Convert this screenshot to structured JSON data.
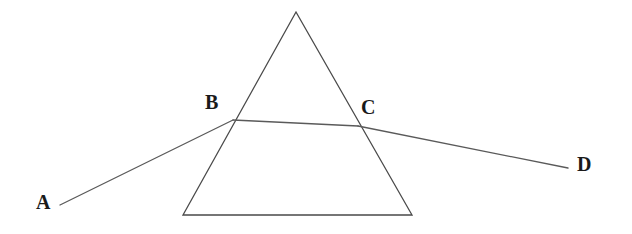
{
  "figure": {
    "kind": "optics-ray-diagram",
    "background_color": "#ffffff",
    "stroke_color": "#555555",
    "prism_stroke_color": "#4a4a4a",
    "ray_stroke_color": "#5a5a5a",
    "label_color": "#1a1a1a"
  },
  "labels": {
    "a": "A",
    "b": "B",
    "c": "C",
    "d": "D"
  },
  "geometry": {
    "prism": {
      "apex": {
        "x": 296,
        "y": 12
      },
      "bottom_left": {
        "x": 183,
        "y": 215
      },
      "bottom_right": {
        "x": 412,
        "y": 215
      },
      "stroke_width": 1.3
    },
    "ray": {
      "incident_start": {
        "x": 60,
        "y": 205
      },
      "entry_point": {
        "x": 233,
        "y": 120
      },
      "exit_point": {
        "x": 358,
        "y": 126
      },
      "emergent_end": {
        "x": 568,
        "y": 168
      },
      "stroke_width": 1.3
    },
    "label_positions": {
      "a": {
        "x": 36,
        "y": 192
      },
      "b": {
        "x": 205,
        "y": 92
      },
      "c": {
        "x": 361,
        "y": 97
      },
      "d": {
        "x": 577,
        "y": 154
      }
    }
  }
}
